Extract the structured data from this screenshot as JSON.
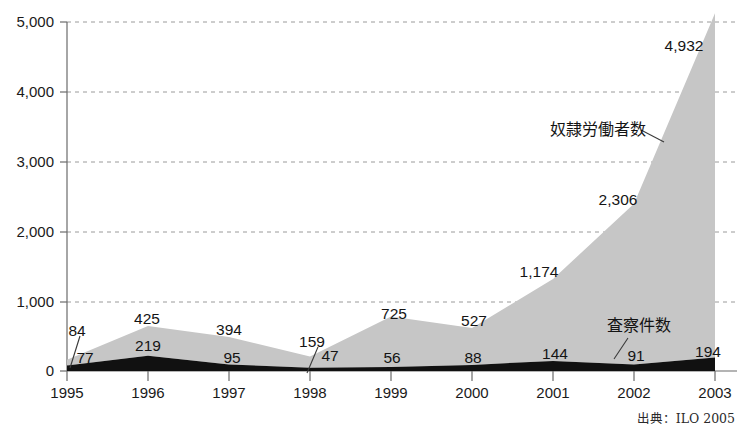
{
  "chart_data": {
    "type": "area",
    "stacked": true,
    "title": "",
    "xlabel": "",
    "ylabel": "",
    "categories": [
      "1995",
      "1996",
      "1997",
      "1998",
      "1999",
      "2000",
      "2001",
      "2002",
      "2003"
    ],
    "x": [
      1995,
      1996,
      1997,
      1998,
      1999,
      2000,
      2001,
      2002,
      2003
    ],
    "ylim": [
      0,
      5000
    ],
    "xlim": [
      1995,
      2003
    ],
    "grid": true,
    "legend_position": "inline-annotations",
    "ytick_labels": [
      "5,000",
      "4,000",
      "3,000",
      "2,000",
      "1,000",
      "0"
    ],
    "ytick_values": [
      5000,
      4000,
      3000,
      2000,
      1000,
      0
    ],
    "series": [
      {
        "name": "奴隷労働者数",
        "color": "#c6c6c6",
        "values": [
          84,
          425,
          394,
          159,
          725,
          527,
          1174,
          2306,
          4932
        ],
        "value_labels": [
          "84",
          "425",
          "394",
          "159",
          "725",
          "527",
          "1,174",
          "2,306",
          "4,932"
        ]
      },
      {
        "name": "査察件数",
        "color": "#111111",
        "values": [
          77,
          219,
          95,
          47,
          56,
          88,
          144,
          91,
          194
        ],
        "value_labels": [
          "77",
          "219",
          "95",
          "47",
          "56",
          "88",
          "144",
          "91",
          "194"
        ]
      }
    ],
    "annotations": [
      {
        "text": "奴隷労働者数",
        "kind": "series-callout"
      },
      {
        "text": "査察件数",
        "kind": "series-callout"
      }
    ],
    "source": "出典：ILO 2005"
  },
  "axis": {
    "y_labels": [
      {
        "text": "5,000",
        "y": 22
      },
      {
        "text": "4,000",
        "y": 92
      },
      {
        "text": "3,000",
        "y": 162
      },
      {
        "text": "2,000",
        "y": 232
      },
      {
        "text": "1,000",
        "y": 302
      },
      {
        "text": "0",
        "y": 371
      }
    ],
    "x_labels": [
      {
        "text": "1995",
        "x": 67
      },
      {
        "text": "1996",
        "x": 148
      },
      {
        "text": "1997",
        "x": 229
      },
      {
        "text": "1998",
        "x": 310
      },
      {
        "text": "1999",
        "x": 391
      },
      {
        "text": "2000",
        "x": 472
      },
      {
        "text": "2001",
        "x": 553
      },
      {
        "text": "2002",
        "x": 634
      },
      {
        "text": "2003",
        "x": 715
      }
    ]
  },
  "labels": {
    "gray_values": [
      {
        "text": "84",
        "x": 77,
        "y": 330
      },
      {
        "text": "425",
        "x": 147,
        "y": 318
      },
      {
        "text": "394",
        "x": 229,
        "y": 329
      },
      {
        "text": "159",
        "x": 312,
        "y": 341
      },
      {
        "text": "725",
        "x": 394,
        "y": 313
      },
      {
        "text": "527",
        "x": 474,
        "y": 320
      },
      {
        "text": "1,174",
        "x": 539,
        "y": 271
      },
      {
        "text": "2,306",
        "x": 618,
        "y": 199
      },
      {
        "text": "4,932",
        "x": 684,
        "y": 45
      }
    ],
    "black_values": [
      {
        "text": "77",
        "x": 85,
        "y": 357
      },
      {
        "text": "219",
        "x": 148,
        "y": 345
      },
      {
        "text": "95",
        "x": 232,
        "y": 357
      },
      {
        "text": "47",
        "x": 330,
        "y": 355
      },
      {
        "text": "56",
        "x": 392,
        "y": 357
      },
      {
        "text": "88",
        "x": 473,
        "y": 357
      },
      {
        "text": "144",
        "x": 555,
        "y": 353
      },
      {
        "text": "91",
        "x": 636,
        "y": 355
      },
      {
        "text": "194",
        "x": 708,
        "y": 351
      }
    ],
    "slave_series": {
      "text": "奴隷労働者数",
      "x": 598,
      "y": 135
    },
    "inspection_series": {
      "text": "査察件数",
      "x": 639,
      "y": 331
    },
    "source": {
      "text": "出典：ILO 2005",
      "x": 735,
      "y": 423
    }
  }
}
